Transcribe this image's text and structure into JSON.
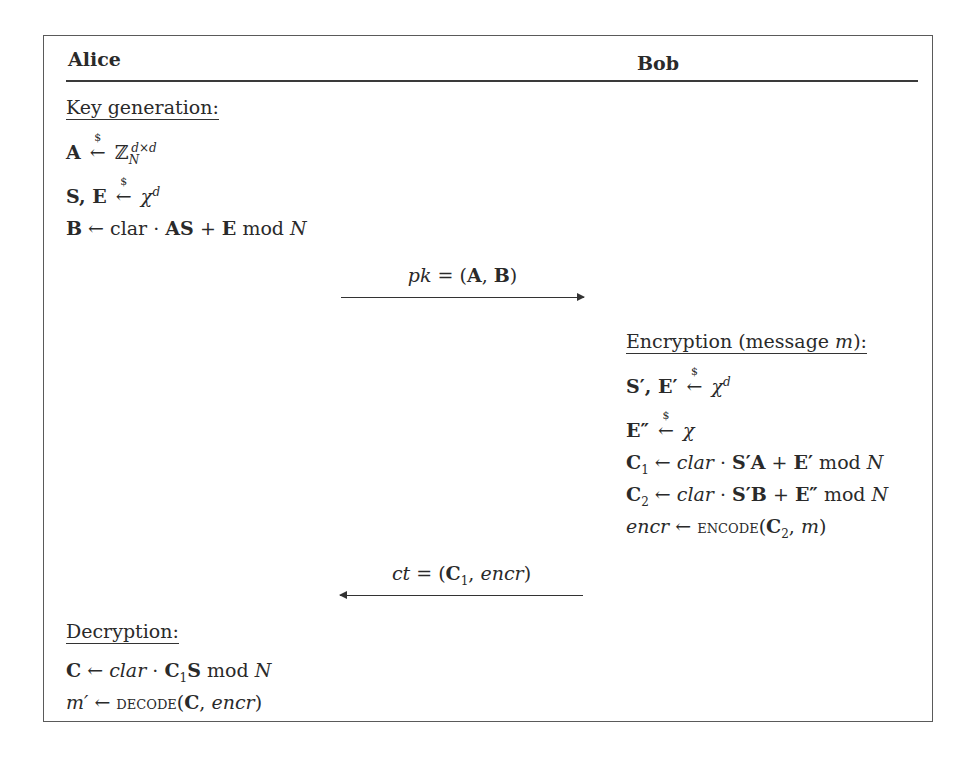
{
  "header": {
    "left_party": "Alice",
    "right_party": "Bob"
  },
  "alice": {
    "keygen": {
      "title": "Key generation:",
      "lines": [
        {
          "lhs": "A",
          "op": "←$",
          "rhs": "ℤ",
          "rhs_sub": "N",
          "rhs_sup": "d×d"
        },
        {
          "lhs": "S, E",
          "op": "←$",
          "rhs": "χ",
          "rhs_sup": "d"
        },
        {
          "lhs": "B",
          "op": "←",
          "rhs": "clar · AS + E mod N"
        }
      ]
    },
    "decrypt": {
      "title": "Decryption:",
      "lines": [
        {
          "lhs": "C",
          "op": "←",
          "rhs": "clar · C₁S mod N"
        },
        {
          "lhs": "m′",
          "op": "←",
          "rhs": "DECODE(C, encr)"
        }
      ]
    }
  },
  "bob": {
    "encrypt": {
      "title": "Encryption (message m):",
      "lines": [
        {
          "lhs": "S′, E′",
          "op": "←$",
          "rhs": "χ",
          "rhs_sup": "d"
        },
        {
          "lhs": "E″",
          "op": "←$",
          "rhs": "χ"
        },
        {
          "lhs": "C₁",
          "op": "←",
          "rhs": "clar · S′A + E′ mod N"
        },
        {
          "lhs": "C₂",
          "op": "←",
          "rhs": "clar · S′B + E″ mod N"
        },
        {
          "lhs": "encr",
          "op": "←",
          "rhs": "ENCODE(C₂, m)"
        }
      ]
    }
  },
  "messages": [
    {
      "label": "pk = (A, B)",
      "direction": "right"
    },
    {
      "label": "ct = (C₁, encr)",
      "direction": "left"
    }
  ],
  "text": {
    "arrow": "←",
    "dollar": "$",
    "mod": "mod",
    "clar": "clar",
    "dot": "·",
    "plus": "+",
    "eq": "=",
    "chi": "χ",
    "ZZ": "ℤ",
    "encode": "encode",
    "decode": "decode",
    "encr": "encr",
    "pk": "pk",
    "ct": "ct",
    "m": "m",
    "N": "N",
    "d": "d",
    "dxd": "d×d",
    "one": "1",
    "two": "2",
    "Encryption": "Encryption (message ",
    "colon_close": "):"
  }
}
